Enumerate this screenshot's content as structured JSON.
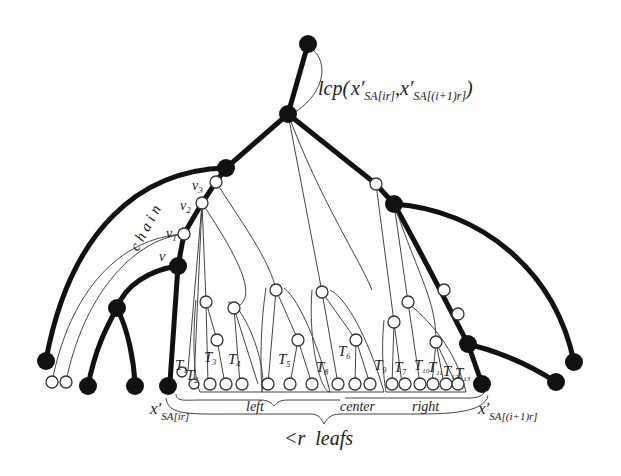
{
  "diagram": {
    "lcp_label": {
      "main": "lcp(",
      "arg1_base": "x",
      "arg1_sub": "SA[ir]",
      "sep": ",",
      "arg2_base": "x",
      "arg2_sub": "SA[(i+1)r]",
      "close": ")"
    },
    "chain_label": "chain",
    "chain_nodes": [
      {
        "id": "v",
        "label": "v"
      },
      {
        "id": "v1",
        "label": "v",
        "sub": "1"
      },
      {
        "id": "v2",
        "label": "v",
        "sub": "2"
      },
      {
        "id": "v3",
        "label": "v",
        "sub": "3"
      }
    ],
    "subtree_labels": [
      {
        "label": "T",
        "sub": "1"
      },
      {
        "label": "T",
        "sub": "2"
      },
      {
        "label": "T",
        "sub": "3"
      },
      {
        "label": "T",
        "sub": "4"
      },
      {
        "label": "T",
        "sub": "5"
      },
      {
        "label": "T",
        "sub": "6"
      },
      {
        "label": "T",
        "sub": "8"
      },
      {
        "label": "T",
        "sub": "9"
      },
      {
        "label": "T",
        "sub": "7"
      },
      {
        "label": "T",
        "sub": "10"
      },
      {
        "label": "T",
        "sub": "11"
      },
      {
        "label": "T",
        "sub": "12"
      },
      {
        "label": "T",
        "sub": "13"
      }
    ],
    "left_leaf_label": {
      "base": "x",
      "sub": "SA[ir]"
    },
    "right_leaf_label": {
      "base": "x",
      "sub": "SA[(i+1)r]"
    },
    "region_labels": {
      "left": "left",
      "center": "center",
      "right": "right"
    },
    "bottom_label": "<r  leafs",
    "colors": {
      "sampled_node": "#111111",
      "unsampled_node": "#ffffff",
      "edge": "#111111",
      "thin_edge": "#444444"
    }
  }
}
